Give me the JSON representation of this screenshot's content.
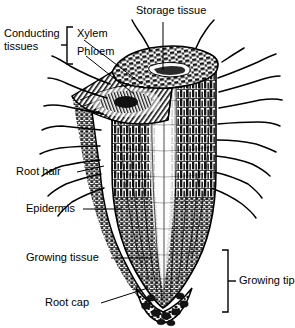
{
  "figure": {
    "style": "black and white line engraving / hatched cell texture",
    "background_color": "#ffffff",
    "ink_color": "#000000",
    "width": 295,
    "height": 328
  },
  "labels": {
    "storage_tissue": "Storage tissue",
    "conducting_tissues": "Conducting tissues",
    "xylem": "Xylem",
    "phloem": "Phloem",
    "root_hair": "Root hair",
    "epidermis": "Epidermis",
    "growing_tissue": "Growing tissue",
    "root_cap": "Root cap",
    "growing_tip": "Growing tip"
  },
  "brackets": {
    "conducting_tissues_bracket": "[",
    "growing_tip_bracket": "]"
  },
  "anatomy": {
    "parts": [
      "storage tissue",
      "xylem",
      "phloem",
      "root hairs",
      "epidermis",
      "growing tissue",
      "root cap"
    ],
    "regions": [
      "conducting tissues",
      "growing tip"
    ]
  }
}
